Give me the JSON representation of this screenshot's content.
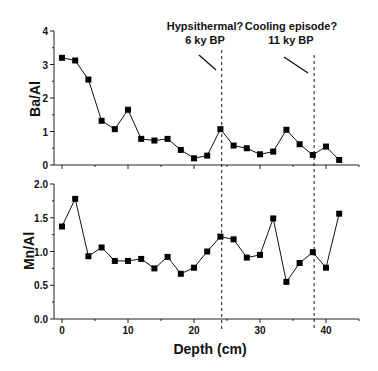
{
  "chart_data": [
    {
      "type": "line",
      "title": "",
      "xlabel": "",
      "ylabel": "Ba/Al",
      "ylim": [
        0,
        4
      ],
      "yticks": [
        "0",
        "1",
        "2",
        "3",
        "4"
      ],
      "x": [
        0,
        2,
        4,
        6,
        8,
        10,
        12,
        14,
        16,
        18,
        20,
        22,
        24,
        26,
        28,
        30,
        32,
        34,
        36,
        38,
        40,
        42
      ],
      "series": [
        {
          "name": "Ba/Al",
          "values": [
            3.2,
            3.12,
            2.55,
            1.32,
            1.07,
            1.65,
            0.78,
            0.73,
            0.78,
            0.45,
            0.2,
            0.28,
            1.07,
            0.58,
            0.5,
            0.32,
            0.4,
            1.05,
            0.62,
            0.3,
            0.55,
            0.15
          ]
        }
      ],
      "marker": "square",
      "annotations": [
        {
          "text_line1": "Hypsithermal?",
          "text_line2": "6 ky BP",
          "x": 24.2
        },
        {
          "text_line1": "Cooling episode?",
          "text_line2": "11 ky BP",
          "x": 38.2
        }
      ]
    },
    {
      "type": "line",
      "title": "",
      "xlabel": "Depth (cm)",
      "ylabel": "Mn/Al",
      "ylim": [
        0,
        2
      ],
      "yticks": [
        "0.0",
        "0.5",
        "1.0",
        "1.5",
        "2.0"
      ],
      "xlim": [
        -1,
        45
      ],
      "xticks": [
        "0",
        "10",
        "20",
        "30",
        "40"
      ],
      "x": [
        0,
        2,
        4,
        6,
        8,
        10,
        12,
        14,
        16,
        18,
        20,
        22,
        24,
        26,
        28,
        30,
        32,
        34,
        36,
        38,
        40,
        42
      ],
      "series": [
        {
          "name": "Mn/Al",
          "values": [
            1.37,
            1.78,
            0.93,
            1.06,
            0.86,
            0.86,
            0.89,
            0.75,
            0.92,
            0.67,
            0.76,
            1.0,
            1.22,
            1.18,
            0.91,
            0.95,
            1.49,
            0.55,
            0.83,
            0.99,
            0.76,
            1.56
          ]
        }
      ],
      "marker": "square",
      "vlines": [
        24.2,
        38.2
      ]
    }
  ],
  "labels": {
    "top_ylabel": "Ba/Al",
    "bottom_ylabel": "Mn/Al",
    "xlabel": "Depth (cm)",
    "annot1_l1": "Hypsithermal?",
    "annot1_l2": "6 ky BP",
    "annot2_l1": "Cooling episode?",
    "annot2_l2": "11 ky BP"
  }
}
